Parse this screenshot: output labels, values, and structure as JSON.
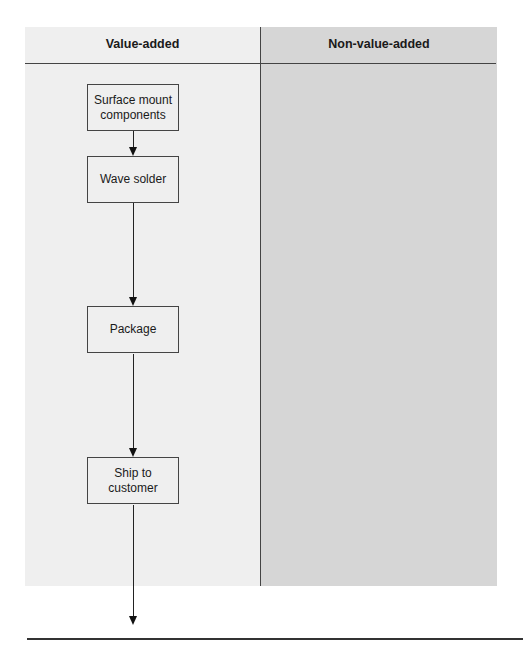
{
  "diagram": {
    "columns": [
      {
        "label": "Value-added"
      },
      {
        "label": "Non-value-added"
      }
    ],
    "steps": [
      {
        "label": "Surface mount components"
      },
      {
        "label": "Wave solder"
      },
      {
        "label": "Package"
      },
      {
        "label": "Ship to customer"
      }
    ],
    "colors": {
      "value_added_bg": "#efefef",
      "non_value_added_bg": "#d6d6d6",
      "line": "#222222"
    }
  }
}
